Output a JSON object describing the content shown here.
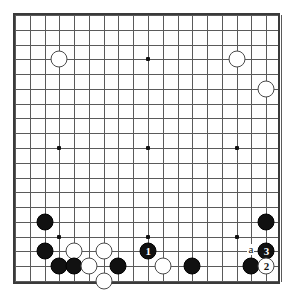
{
  "diagram": {
    "kind": "go-board-diagram",
    "board_size": 19,
    "geometry": {
      "origin_x": 14,
      "origin_y": 14,
      "spacing": 14.78,
      "stone_diameter": 17
    },
    "colors": {
      "background": "#ffffff",
      "border": "#3a3a3a",
      "grid": "#5a5a5a",
      "black_stone": "#111111",
      "white_stone": "#ffffff",
      "white_stone_edge": "#4a4a4a",
      "star_point": "#111111",
      "label_text": "#111111"
    },
    "star_points": [
      {
        "col": 4,
        "row": 4
      },
      {
        "col": 10,
        "row": 4
      },
      {
        "col": 16,
        "row": 4
      },
      {
        "col": 4,
        "row": 10
      },
      {
        "col": 10,
        "row": 10
      },
      {
        "col": 16,
        "row": 10
      },
      {
        "col": 4,
        "row": 16
      },
      {
        "col": 10,
        "row": 16
      },
      {
        "col": 16,
        "row": 16
      }
    ],
    "stones": [
      {
        "col": 4,
        "row": 4,
        "color": "white",
        "label": ""
      },
      {
        "col": 16,
        "row": 4,
        "color": "white",
        "label": ""
      },
      {
        "col": 18,
        "row": 6,
        "color": "white",
        "label": ""
      },
      {
        "col": 3,
        "row": 15,
        "color": "black",
        "label": ""
      },
      {
        "col": 18,
        "row": 15,
        "color": "black",
        "label": ""
      },
      {
        "col": 3,
        "row": 17,
        "color": "black",
        "label": ""
      },
      {
        "col": 5,
        "row": 17,
        "color": "white",
        "label": ""
      },
      {
        "col": 7,
        "row": 17,
        "color": "white",
        "label": ""
      },
      {
        "col": 10,
        "row": 17,
        "color": "black",
        "label": "1"
      },
      {
        "col": 18,
        "row": 17,
        "color": "black",
        "label": "3"
      },
      {
        "col": 4,
        "row": 18,
        "color": "black",
        "label": ""
      },
      {
        "col": 5,
        "row": 18,
        "color": "black",
        "label": ""
      },
      {
        "col": 6,
        "row": 18,
        "color": "white",
        "label": ""
      },
      {
        "col": 8,
        "row": 18,
        "color": "black",
        "label": ""
      },
      {
        "col": 11,
        "row": 18,
        "color": "white",
        "label": ""
      },
      {
        "col": 13,
        "row": 18,
        "color": "black",
        "label": ""
      },
      {
        "col": 17,
        "row": 18,
        "color": "black",
        "label": ""
      },
      {
        "col": 18,
        "row": 18,
        "color": "white",
        "label": "2"
      },
      {
        "col": 7,
        "row": 19,
        "color": "white",
        "label": ""
      }
    ],
    "point_labels": [
      {
        "col": 17,
        "row": 17,
        "text": "a"
      }
    ]
  }
}
